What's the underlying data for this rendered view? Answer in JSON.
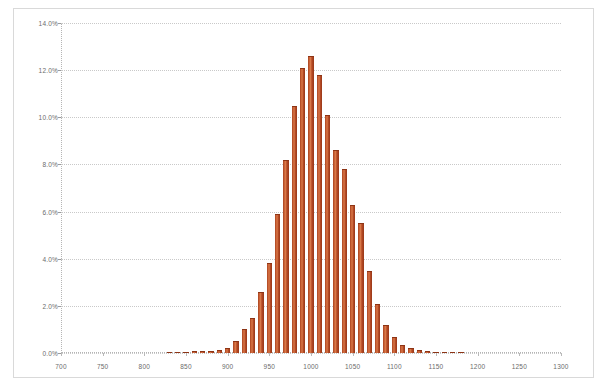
{
  "chart_data": {
    "type": "bar",
    "title": "",
    "subtitle": "",
    "xlabel": "",
    "ylabel": "",
    "xlim": [
      700,
      1300
    ],
    "ylim": [
      0,
      14
    ],
    "grid": true,
    "legend": null,
    "y_unit": "%",
    "bin_width": 10,
    "x_ticks": [
      700,
      750,
      800,
      850,
      900,
      950,
      1000,
      1050,
      1100,
      1150,
      1200,
      1250,
      1300
    ],
    "x_tick_labels": [
      "700",
      "750",
      "800",
      "850",
      "900",
      "950",
      "1000",
      "1050",
      "1100",
      "1150",
      "1200",
      "1250",
      "1300"
    ],
    "y_ticks": [
      0,
      2,
      4,
      6,
      8,
      10,
      12,
      14
    ],
    "y_tick_labels": [
      "0.0%",
      "2.0%",
      "4.0%",
      "6.0%",
      "8.0%",
      "10.0%",
      "12.0%",
      "14.0%"
    ],
    "series_name": "frequency",
    "bar_color": "#c0522d",
    "bar_edge_color": "#8d3415",
    "categories": [
      830,
      840,
      850,
      860,
      870,
      880,
      890,
      900,
      910,
      920,
      930,
      940,
      950,
      960,
      970,
      980,
      990,
      1000,
      1010,
      1020,
      1030,
      1040,
      1050,
      1060,
      1070,
      1080,
      1090,
      1100,
      1110,
      1120,
      1130,
      1140,
      1150,
      1160,
      1170,
      1180
    ],
    "values": [
      0.05,
      0.05,
      0.05,
      0.08,
      0.08,
      0.1,
      0.12,
      0.2,
      0.5,
      1.0,
      1.5,
      2.6,
      3.8,
      5.9,
      8.2,
      10.5,
      12.1,
      12.6,
      11.8,
      10.1,
      8.6,
      7.8,
      6.3,
      5.5,
      3.5,
      2.1,
      1.2,
      0.7,
      0.35,
      0.2,
      0.12,
      0.08,
      0.06,
      0.05,
      0.05,
      0.05
    ]
  }
}
